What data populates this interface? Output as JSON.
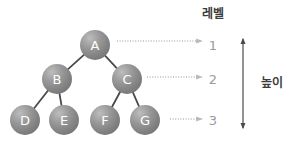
{
  "diagram": {
    "title_level": "레벨",
    "title_height": "높이",
    "nodes": [
      {
        "id": "A",
        "label": "A",
        "cx": 95,
        "cy": 45,
        "r": 15
      },
      {
        "id": "B",
        "label": "B",
        "cx": 57,
        "cy": 79,
        "r": 15
      },
      {
        "id": "C",
        "label": "C",
        "cx": 127,
        "cy": 79,
        "r": 15
      },
      {
        "id": "D",
        "label": "D",
        "cx": 25,
        "cy": 120,
        "r": 15
      },
      {
        "id": "E",
        "label": "E",
        "cx": 64,
        "cy": 120,
        "r": 15
      },
      {
        "id": "F",
        "label": "F",
        "cx": 105,
        "cy": 120,
        "r": 15
      },
      {
        "id": "G",
        "label": "G",
        "cx": 145,
        "cy": 120,
        "r": 15
      }
    ],
    "edges": [
      {
        "from": "A",
        "to": "B"
      },
      {
        "from": "A",
        "to": "C"
      },
      {
        "from": "B",
        "to": "D"
      },
      {
        "from": "B",
        "to": "E"
      },
      {
        "from": "C",
        "to": "F"
      },
      {
        "from": "C",
        "to": "G"
      }
    ],
    "levels": [
      {
        "label": "1",
        "num_x": 213,
        "num_y": 45,
        "arrow_x1": 117,
        "arrow_x2": 202,
        "arrow_y": 41
      },
      {
        "label": "2",
        "num_x": 213,
        "num_y": 79,
        "arrow_x1": 147,
        "arrow_x2": 202,
        "arrow_y": 77
      },
      {
        "label": "3",
        "num_x": 213,
        "num_y": 120,
        "arrow_x1": 170,
        "arrow_x2": 202,
        "arrow_y": 119
      }
    ],
    "height_arrow": {
      "x": 243,
      "y_top": 39,
      "y_bottom": 128
    },
    "label_level_pos": {
      "x": 213,
      "y": 14
    },
    "label_height_pos": {
      "x": 272,
      "y": 83
    },
    "colors": {
      "node_fill": "#8a8a8a",
      "node_fill_light": "#b4b4b4",
      "node_fill_dark": "#6e6e6e",
      "node_text": "#ffffff",
      "edge": "#4a4a4a",
      "dotted_arrow": "#b9b9b9",
      "level_number": "#9b9b9b",
      "height_arrow": "#4a4a4a",
      "kr_text": "#3c3c3c",
      "background": "#ffffff"
    }
  }
}
